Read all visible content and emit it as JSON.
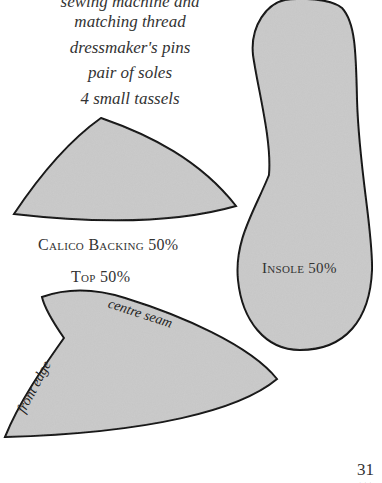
{
  "materials": {
    "items": [
      "sewing machine and",
      "matching thread",
      "dressmaker's pins",
      "pair of soles",
      "4 small tassels"
    ]
  },
  "pieces": {
    "calico_backing": {
      "label": "Calico Backing 50%"
    },
    "top": {
      "label": "Top 50%",
      "annotations": [
        "centre seam",
        "front edge"
      ]
    },
    "insole": {
      "label": "Insole 50%"
    }
  },
  "colors": {
    "fabric_fill": "#c6c6c6",
    "outline": "#111111",
    "text": "#333333"
  },
  "page": {
    "number": "31",
    "ornament": "..."
  }
}
